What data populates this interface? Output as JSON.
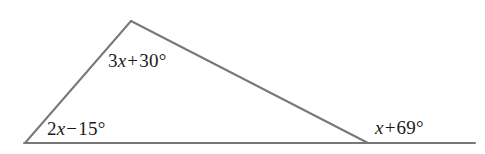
{
  "figure": {
    "type": "triangle-with-exterior-angle",
    "background_color": "#ffffff",
    "stroke_color": "#77787a",
    "text_color": "#1a1a1a",
    "stroke_width": 2,
    "canvas": {
      "width": 485,
      "height": 154
    },
    "vertices": {
      "left": {
        "x": 25,
        "y": 143
      },
      "apex": {
        "x": 131,
        "y": 21
      },
      "right": {
        "x": 368,
        "y": 143
      }
    },
    "baseline_extension_end": {
      "x": 475,
      "y": 143
    },
    "segments": [
      {
        "name": "left-side",
        "from": "left",
        "to": "apex"
      },
      {
        "name": "right-side",
        "from": "apex",
        "to": "right"
      },
      {
        "name": "base-with-extension",
        "from": "left",
        "to": "baseline_extension_end"
      }
    ],
    "labels": {
      "apex_angle": {
        "coefficient": "3",
        "variable": "x",
        "operator": "+",
        "constant": "30°",
        "text": "3x + 30°"
      },
      "lower_left_angle": {
        "coefficient": "2",
        "variable": "x",
        "operator": "−",
        "constant": "15°",
        "text": "2x − 15°"
      },
      "exterior_angle": {
        "coefficient": "",
        "variable": "x",
        "operator": "+",
        "constant": "69°",
        "text": "x + 69°"
      }
    }
  }
}
